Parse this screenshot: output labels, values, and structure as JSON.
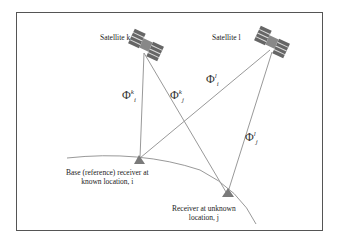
{
  "diagram": {
    "satellites": [
      {
        "id": "k",
        "label": "Satellite k"
      },
      {
        "id": "l",
        "label": "Satellite l"
      }
    ],
    "receivers": [
      {
        "id": "i",
        "label_line1": "Base (reference) receiver at",
        "label_line2": "known location, i"
      },
      {
        "id": "j",
        "label_line1": "Receiver at unknown",
        "label_line2": "location, j"
      }
    ],
    "ranges": [
      {
        "symbol": "Φ",
        "sup": "k",
        "sub": "i"
      },
      {
        "symbol": "Φ",
        "sup": "k",
        "sub": "j"
      },
      {
        "symbol": "Φ",
        "sup": "l",
        "sub": "i"
      },
      {
        "symbol": "Φ",
        "sup": "l",
        "sub": "j"
      }
    ],
    "colors": {
      "line": "#999999",
      "triangle": "#7a7a7a",
      "border": "#555555"
    }
  }
}
